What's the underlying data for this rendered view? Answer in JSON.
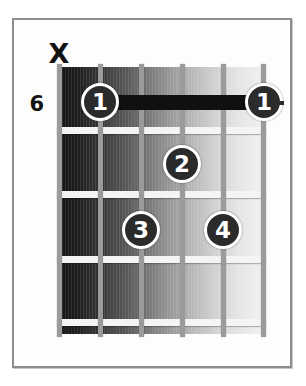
{
  "diagram": {
    "type": "guitar-chord-chart",
    "starting_fret_label": "6",
    "mute_marker": "X",
    "strings_count": 6,
    "frets_count": 4,
    "colors": {
      "frame_border": "#8e8e8e",
      "page_background": "#ffffff",
      "fret_wire": "#f4f4f2",
      "string": "#9b9b9b",
      "dot_fill": "#2b2b2b",
      "dot_ring": "#ffffff",
      "dot_text": "#ffffff",
      "barre": "#101010",
      "label_text": "#121212"
    },
    "markers": [
      {
        "label": "X",
        "name": "mute-marker-string-6",
        "string": 6,
        "meaning": "do-not-play"
      }
    ],
    "fingerings": [
      {
        "label": "1",
        "name": "finger-dot-1-low",
        "string": 5,
        "fret": 1,
        "x": 98,
        "y": 100
      },
      {
        "label": "1",
        "name": "finger-dot-1-high",
        "string": 1,
        "fret": 1,
        "x": 262,
        "y": 100
      },
      {
        "label": "2",
        "name": "finger-dot-2",
        "string": 3,
        "fret": 2,
        "x": 180,
        "y": 162
      },
      {
        "label": "3",
        "name": "finger-dot-3",
        "string": 4,
        "fret": 3,
        "x": 139,
        "y": 228
      },
      {
        "label": "4",
        "name": "finger-dot-4",
        "string": 2,
        "fret": 3,
        "x": 221,
        "y": 228
      }
    ],
    "barre": {
      "name": "barre-bar",
      "label": "barre",
      "fret": 1,
      "from_string": 5,
      "to_string": 1,
      "x": 98,
      "width": 164,
      "y": 100
    },
    "fret_lines_y": [
      128,
      192,
      257,
      320
    ],
    "string_x": [
      57,
      98,
      139,
      180,
      221,
      262
    ]
  }
}
